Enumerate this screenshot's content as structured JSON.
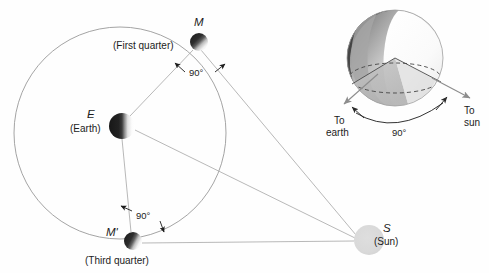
{
  "figure": {
    "background_color": "#fefefe"
  },
  "orbit": {
    "name": "moon-orbit-circle",
    "center_x": 120,
    "center_y": 133,
    "radius": 106,
    "stroke_color": "#9a9a9a"
  },
  "bodies": {
    "earth": {
      "symbol": "E",
      "caption": "(Earth)",
      "cx": 122,
      "cy": 126,
      "r": 13,
      "lit_side": "right",
      "dark_color": "#2a2a2a",
      "light_color": "#ffffff"
    },
    "moon_first_quarter": {
      "symbol": "M",
      "caption": "(First quarter)",
      "cx": 199,
      "cy": 42,
      "r": 9,
      "lit_side": "lower-right",
      "dark_color": "#303030",
      "light_color": "#fbfbfb"
    },
    "moon_third_quarter": {
      "symbol": "M'",
      "caption": "(Third quarter)",
      "cx": 133,
      "cy": 241,
      "r": 9,
      "lit_side": "right",
      "dark_color": "#303030",
      "light_color": "#fbfbfb"
    },
    "sun": {
      "symbol": "S",
      "caption": "(Sun)",
      "cx": 369,
      "cy": 240,
      "r": 15,
      "fill_color": "#d9d9d9"
    }
  },
  "angles": {
    "first_quarter": {
      "value": "90°",
      "x": 196,
      "y": 73
    },
    "third_quarter": {
      "value": "90°",
      "x": 141,
      "y": 215
    },
    "globe": {
      "value": "90°",
      "x": 398,
      "y": 135
    }
  },
  "globe_inset": {
    "name": "moon-terminator-globe",
    "cx": 395,
    "cy": 58,
    "r": 48,
    "to_earth_label_line1": "To",
    "to_earth_label_line2": "earth",
    "to_sun_label_line1": "To",
    "to_sun_label_line2": "sun",
    "dark_color": "#4a4a4a",
    "mid_color": "#b9b9b9",
    "light_color": "#fdfdfd",
    "wedge_color": "#c9c9c9"
  },
  "lines": {
    "stroke_color": "#b0b0b0",
    "rays": [
      {
        "name": "moon-first-quarter-to-sun",
        "x1": 201,
        "y1": 50,
        "x2": 356,
        "y2": 235
      },
      {
        "name": "earth-to-sun",
        "x1": 135,
        "y1": 130,
        "x2": 355,
        "y2": 238
      },
      {
        "name": "moon-third-quarter-to-sun",
        "x1": 142,
        "y1": 243,
        "x2": 354,
        "y2": 241
      },
      {
        "name": "earth-to-moon-first-quarter",
        "x1": 130,
        "y1": 116,
        "x2": 193,
        "y2": 50
      },
      {
        "name": "earth-to-moon-third-quarter",
        "x1": 122,
        "y1": 139,
        "x2": 131,
        "y2": 232
      }
    ]
  }
}
